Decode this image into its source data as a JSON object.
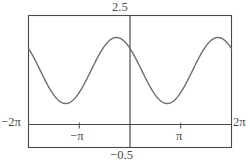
{
  "chart_data": {
    "type": "line",
    "title": "",
    "xlabel": "",
    "ylabel": "",
    "xlim": [
      -6.283185307179586,
      6.283185307179586
    ],
    "ylim": [
      -0.5,
      2.5
    ],
    "grid": false,
    "legend": null,
    "axis_labels": {
      "x_min": "−2π",
      "x_max": "2π",
      "y_max": "2.5",
      "y_min": "−0.5"
    },
    "x_ticks": [
      {
        "value": -3.141592653589793,
        "label": "−π"
      },
      {
        "value": 3.141592653589793,
        "label": "π"
      }
    ],
    "y_ticks": [],
    "axes": {
      "x_axis_at_y": 0,
      "y_axis_at_x": 0
    },
    "series": [
      {
        "name": "curve",
        "color": "#6e6e6e",
        "line_width": 1.4,
        "function": "y = 1.25 - 0.75*cos(x - 2.3)",
        "amplitude": 0.75,
        "midline": 1.25,
        "period": 6.283185307179586,
        "phase": 2.3,
        "y_max_value": 2.0,
        "y_min_value": 0.5,
        "value_at_x0": 1.0,
        "peaks_x": [
          -3.98,
          2.3
        ],
        "troughs_x": [
          -0.84,
          5.44
        ],
        "x": [
          -6.283,
          -5.969,
          -5.655,
          -5.341,
          -5.027,
          -4.712,
          -4.398,
          -4.084,
          -3.77,
          -3.456,
          -3.142,
          -2.827,
          -2.513,
          -2.199,
          -1.885,
          -1.571,
          -1.257,
          -0.942,
          -0.628,
          -0.314,
          0.0,
          0.314,
          0.628,
          0.942,
          1.257,
          1.571,
          1.885,
          2.199,
          2.513,
          2.827,
          3.142,
          3.456,
          3.77,
          4.084,
          4.398,
          4.712,
          5.027,
          5.341,
          5.655,
          5.969,
          6.283
        ],
        "y": [
          1.0,
          1.22,
          1.45,
          1.65,
          1.82,
          1.94,
          1.99,
          2.0,
          1.94,
          1.83,
          1.68,
          1.5,
          1.3,
          1.11,
          0.93,
          0.77,
          0.65,
          0.56,
          0.51,
          0.5,
          1.0,
          0.53,
          0.59,
          0.7,
          0.84,
          1.01,
          1.2,
          1.39,
          1.58,
          1.75,
          1.88,
          1.96,
          2.0,
          1.98,
          1.91,
          1.8,
          1.65,
          1.46,
          1.27,
          1.07,
          0.88
        ]
      }
    ],
    "style": {
      "frame_color": "#4a4a4a",
      "axis_color": "#4a4a4a",
      "background": "#ffffff"
    }
  }
}
